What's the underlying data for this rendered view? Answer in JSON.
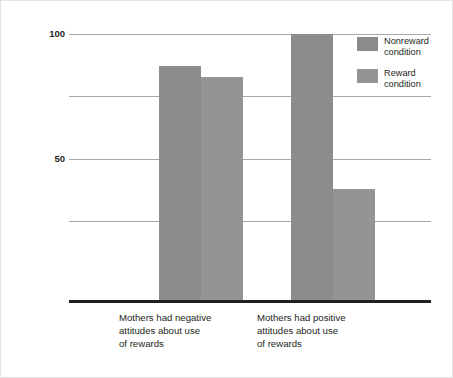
{
  "chart_data": {
    "type": "bar",
    "title": "",
    "subtitle": "",
    "xlabel": "",
    "ylabel": "Percentage of Children Who Helped",
    "ylim": [
      0,
      100
    ],
    "yticks": [
      50,
      100
    ],
    "gridlines": [
      25,
      50,
      75,
      100
    ],
    "grid": true,
    "legend_position": "top-right",
    "categories": [
      "Mothers had negative\nattitudes about use\nof rewards",
      "Mothers had positive\nattitudes about use\nof rewards"
    ],
    "series": [
      {
        "name": "Nonreward condition",
        "values": [
          88,
          100
        ],
        "color": "#8c8c8c"
      },
      {
        "name": "Reward condition",
        "values": [
          84,
          42
        ],
        "color": "#949494"
      }
    ]
  },
  "axis": {
    "y_title": "Percentage of Children Who Helped",
    "y_tick_100": "100",
    "y_tick_50": "50"
  },
  "categories": {
    "label_0": "Mothers had negative\nattitudes about use\nof rewards",
    "label_1": "Mothers had positive\nattitudes about use\nof rewards"
  },
  "legend": {
    "items": [
      {
        "label": "Nonreward\ncondition",
        "color": "#8c8c8c"
      },
      {
        "label": "Reward\ncondition",
        "color": "#949494"
      }
    ]
  },
  "colors": {
    "bar_nonreward": "#8c8c8c",
    "bar_reward": "#949494",
    "gridline": "#a8a8a8",
    "axis": "#231f20",
    "background": "#ffffff",
    "border": "#e3e3e3"
  }
}
